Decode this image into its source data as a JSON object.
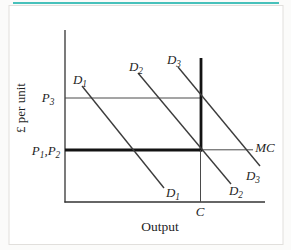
{
  "figure": {
    "background": "#ffffff",
    "page_background": "#fbfbfa",
    "frame_color": "#e1dfdc",
    "accent_top_rule_color": "#48c1bb",
    "axis_color": "#333333",
    "line_color": "#3c3c3c",
    "bold_line_color": "#131313"
  },
  "diagram": {
    "y_axis_title": "£ per unit",
    "x_axis_title": "Output",
    "lines": [
      {
        "name": "y-axis",
        "x1": 65,
        "y1": 30,
        "x2": 65,
        "y2": 202.6,
        "width": 1.3,
        "color": "#333333"
      },
      {
        "name": "x-axis",
        "x1": 64.4,
        "y1": 202,
        "x2": 265,
        "y2": 202,
        "width": 1.3,
        "color": "#333333"
      },
      {
        "name": "p3-price-line",
        "x1": 65,
        "y1": 98,
        "x2": 202,
        "y2": 98,
        "width": 1,
        "color": "#4a4a4a"
      },
      {
        "name": "mc-horizontal-thin",
        "x1": 200,
        "y1": 149.8,
        "x2": 253,
        "y2": 149.8,
        "width": 1,
        "color": "#4a4a4a"
      },
      {
        "name": "mc-horizontal-thick",
        "x1": 65,
        "y1": 150,
        "x2": 202.3,
        "y2": 150,
        "width": 2.8,
        "color": "#131313"
      },
      {
        "name": "capacity-vertical-thick",
        "x1": 201,
        "y1": 58,
        "x2": 201,
        "y2": 151.4,
        "width": 2.8,
        "color": "#131313"
      },
      {
        "name": "capacity-vertical-thin",
        "x1": 200.5,
        "y1": 150,
        "x2": 200.5,
        "y2": 202,
        "width": 1,
        "color": "#4a4a4a"
      },
      {
        "name": "d1-demand-line",
        "x1": 82,
        "y1": 86,
        "x2": 164,
        "y2": 188,
        "width": 1.4,
        "color": "#3c3c3c"
      },
      {
        "name": "d2-demand-line",
        "x1": 138,
        "y1": 73,
        "x2": 231,
        "y2": 184,
        "width": 1.4,
        "color": "#3c3c3c"
      },
      {
        "name": "d3-demand-line",
        "x1": 178,
        "y1": 67,
        "x2": 260,
        "y2": 166,
        "width": 1.4,
        "color": "#3c3c3c"
      }
    ],
    "labels": [
      {
        "name": "p3-label",
        "text": "P_3",
        "x": 48,
        "y": 102,
        "italic": true,
        "size": 13
      },
      {
        "name": "p1-p2-label",
        "text": "P_1,P_2",
        "x": 46,
        "y": 155,
        "italic": true,
        "size": 13
      },
      {
        "name": "d1-top-label",
        "text": "D_1",
        "x": 80,
        "y": 84,
        "italic": true,
        "size": 13
      },
      {
        "name": "d2-top-label",
        "text": "D_2",
        "x": 136,
        "y": 71,
        "italic": true,
        "size": 13
      },
      {
        "name": "d3-top-label",
        "text": "D_3",
        "x": 174,
        "y": 64,
        "italic": true,
        "size": 13
      },
      {
        "name": "d1-bottom-label",
        "text": "D_1",
        "x": 173,
        "y": 197,
        "italic": true,
        "size": 13
      },
      {
        "name": "d2-bottom-label",
        "text": "D_2",
        "x": 236,
        "y": 195,
        "italic": true,
        "size": 13
      },
      {
        "name": "d3-bottom-label",
        "text": "D_3",
        "x": 253,
        "y": 180,
        "italic": true,
        "size": 13
      },
      {
        "name": "mc-label",
        "text": "MC",
        "x": 265,
        "y": 152,
        "italic": true,
        "size": 13
      },
      {
        "name": "capacity-label",
        "text": "C",
        "x": 200,
        "y": 216,
        "italic": true,
        "size": 13
      },
      {
        "name": "y-axis-title",
        "text": "£ per unit",
        "x": 25,
        "y": 108,
        "italic": false,
        "size": 13,
        "rotate": -90
      },
      {
        "name": "x-axis-title",
        "text": "Output",
        "x": 160,
        "y": 231,
        "italic": false,
        "size": 13.5
      }
    ]
  },
  "chart_data": {
    "type": "line",
    "title": "",
    "xlabel": "Output",
    "ylabel": "£ per unit",
    "x_axis_tick_labels": [
      "C"
    ],
    "y_axis_tick_labels": [
      "P₃",
      "P₁,P₂"
    ],
    "grid": false,
    "series": [
      {
        "name": "D₁",
        "kind": "demand",
        "description": "downward-sloping demand; intersects MC left of capacity C at price P₁"
      },
      {
        "name": "D₂",
        "kind": "demand",
        "description": "downward-sloping demand; intersects MC exactly at capacity C at price P₂ (= P₁)"
      },
      {
        "name": "D₃",
        "kind": "demand",
        "description": "downward-sloping demand; intersects vertical capacity segment at price P₃"
      },
      {
        "name": "MC",
        "kind": "marginal-cost",
        "description": "horizontal (bold) at P₁,P₂ from origin axis to capacity C, then vertical (bold) at output C; thin horizontal extension labelled MC to the right"
      }
    ]
  }
}
